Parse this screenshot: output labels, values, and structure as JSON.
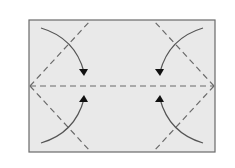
{
  "diagram": {
    "type": "origami-fold-diagram",
    "colors": {
      "background": "#ffffff",
      "paper_fill": "#e9e9e9",
      "border": "#6a6a6a",
      "dash_line": "#6a6a6a",
      "arrow": "#555555",
      "arrowhead": "#111111"
    },
    "paper": {
      "x": 29,
      "y": 20,
      "width": 186,
      "height": 132
    },
    "fold_lines": [
      {
        "name": "center-horizontal",
        "x1": 30,
        "y1": 86,
        "x2": 214,
        "y2": 86
      },
      {
        "name": "top-left-diagonal",
        "x1": 30,
        "y1": 86,
        "x2": 90,
        "y2": 21
      },
      {
        "name": "bottom-left-diagonal",
        "x1": 30,
        "y1": 86,
        "x2": 90,
        "y2": 151
      },
      {
        "name": "top-right-diagonal",
        "x1": 214,
        "y1": 86,
        "x2": 154,
        "y2": 21
      },
      {
        "name": "bottom-right-diagonal",
        "x1": 214,
        "y1": 86,
        "x2": 154,
        "y2": 151
      }
    ],
    "arrows": [
      {
        "name": "arrow-top-left",
        "path": "M41 28 Q75 38 84 72",
        "head": "84,76 79,69 88,69"
      },
      {
        "name": "arrow-bottom-left",
        "path": "M41 143 Q75 133 84 99",
        "head": "84,95 79,102 88,102"
      },
      {
        "name": "arrow-top-right",
        "path": "M203 28 Q169 38 160 72",
        "head": "160,76 155,69 164,69"
      },
      {
        "name": "arrow-bottom-right",
        "path": "M203 143 Q169 133 160 99",
        "head": "160,95 155,102 164,102"
      }
    ]
  }
}
